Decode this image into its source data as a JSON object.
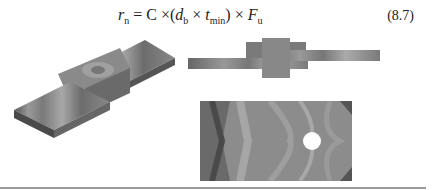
{
  "equation": {
    "lhs_var": "r",
    "lhs_sub": "n",
    "equals": "=",
    "coef": "C",
    "times": "×",
    "open": "(",
    "d_var": "d",
    "d_sub": "b",
    "t_var": "t",
    "t_sub": "min",
    "close": ")",
    "f_var": "F",
    "f_sub": "u",
    "number": "(8.7)"
  },
  "figures": [
    {
      "name": "lap-joint-3d-stress-contour"
    },
    {
      "name": "lap-joint-side-view-stress-contour"
    },
    {
      "name": "plate-with-hole-stress-contour"
    }
  ]
}
